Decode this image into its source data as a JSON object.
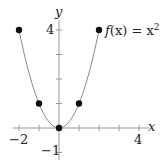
{
  "chart_data": {
    "type": "line",
    "title": "",
    "function_label": "f(x) = x²",
    "xlabel": "x",
    "ylabel": "y",
    "xlim": [
      -2.3,
      4.5
    ],
    "ylim": [
      -1.3,
      4.4
    ],
    "x_ticks": [
      -2,
      -1,
      1,
      2,
      3,
      4
    ],
    "y_ticks": [
      -1,
      1,
      2,
      3,
      4
    ],
    "x_tick_labels": [
      "-2",
      "4"
    ],
    "y_tick_labels": [
      "-1",
      "4"
    ],
    "curve": {
      "expression": "x^2",
      "domain": [
        -2,
        2
      ]
    },
    "points": [
      {
        "x": -2,
        "y": 4
      },
      {
        "x": -1,
        "y": 1
      },
      {
        "x": 0,
        "y": 0
      },
      {
        "x": 1,
        "y": 1
      },
      {
        "x": 2,
        "y": 4
      }
    ],
    "colors": {
      "curve": "#888888",
      "points": "#111111",
      "axes": "#999999"
    },
    "grid": false
  },
  "labels": {
    "x_axis": "x",
    "y_axis": "y",
    "x_min": "−2",
    "x_max": "4",
    "y_min": "−1",
    "y_max": "4",
    "func_f": "f",
    "func_rest": "(x) = x",
    "func_exp": "2"
  }
}
